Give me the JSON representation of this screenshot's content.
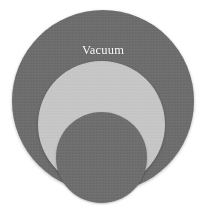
{
  "diagram": {
    "type": "nested-circles",
    "background_color": "#ffffff",
    "width": 209,
    "height": 214,
    "rings": [
      {
        "id": "vacuum",
        "label": "Vacuum",
        "level": 1,
        "fill_color": "#6d6d6d",
        "label_color": "#ffffff"
      },
      {
        "id": "cryogenics",
        "label": "Cryogenics",
        "level": 2,
        "fill_color": "#c6c6c6",
        "label_color": "#ffffff"
      },
      {
        "id": "superconductivity",
        "label": "Superconductivity",
        "level": 3,
        "fill_color": "#6e6e6e",
        "label_color": "#ffffff"
      }
    ]
  }
}
